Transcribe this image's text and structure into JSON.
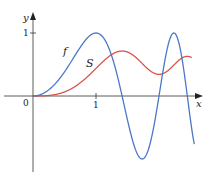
{
  "chart_data": {
    "type": "line",
    "title": "",
    "xlabel": "x",
    "ylabel": "y",
    "origin_label": "0",
    "x_ticks": [
      {
        "value": 1,
        "label": "1"
      }
    ],
    "y_ticks": [
      {
        "value": 1,
        "label": "1"
      }
    ],
    "xlim": [
      0,
      2.65
    ],
    "ylim": [
      -1.3,
      1.3
    ],
    "grid": false,
    "legend": "inline labels",
    "series": [
      {
        "name": "f",
        "label": "f",
        "color": "#4a78c8",
        "description": "f(x) = sin(pi x^2 / 2)",
        "x": [
          0,
          0.25,
          0.5,
          0.75,
          1.0,
          1.25,
          1.5,
          1.75,
          2.0,
          2.25,
          2.5,
          2.55
        ],
        "values": [
          0,
          0.1,
          0.38,
          0.77,
          1.0,
          0.63,
          -0.38,
          -0.99,
          0.0,
          1.0,
          -0.22,
          -0.54
        ]
      },
      {
        "name": "S",
        "label": "S",
        "color": "#d9534a",
        "description": "S(x) = integral from 0 to x of sin(pi t^2 / 2) dt",
        "x": [
          0,
          0.25,
          0.5,
          0.75,
          1.0,
          1.25,
          1.5,
          1.75,
          2.0,
          2.25,
          2.5
        ],
        "values": [
          0,
          0.01,
          0.06,
          0.2,
          0.44,
          0.65,
          0.7,
          0.56,
          0.34,
          0.4,
          0.62
        ]
      }
    ]
  }
}
